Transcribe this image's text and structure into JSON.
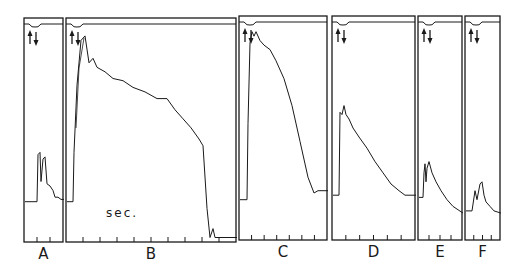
{
  "chart_data": {
    "type": "line",
    "title": "",
    "xlabel": "sec.",
    "ylabel": "",
    "grid": false,
    "legend": null,
    "panels": [
      {
        "label": "A",
        "box": [
          24,
          18,
          63,
          242
        ],
        "ticks": 2,
        "baseline": 82,
        "trace": [
          [
            0,
            82
          ],
          [
            12,
            82
          ],
          [
            13,
            61
          ],
          [
            15,
            60
          ],
          [
            16,
            73
          ],
          [
            18,
            63
          ],
          [
            20,
            62
          ],
          [
            22,
            74
          ],
          [
            25,
            75
          ],
          [
            28,
            77
          ],
          [
            30,
            80
          ],
          [
            33,
            80
          ],
          [
            36,
            81
          ],
          [
            39,
            81
          ]
        ]
      },
      {
        "label": "B",
        "box": [
          66,
          18,
          236,
          242
        ],
        "ticks": 9,
        "baseline": 82,
        "trace": [
          [
            0,
            82
          ],
          [
            6,
            82
          ],
          [
            7,
            60
          ],
          [
            10,
            30
          ],
          [
            14,
            10
          ],
          [
            18,
            8
          ],
          [
            22,
            20
          ],
          [
            26,
            18
          ],
          [
            30,
            22
          ],
          [
            38,
            24
          ],
          [
            46,
            27
          ],
          [
            56,
            28
          ],
          [
            66,
            31
          ],
          [
            78,
            33
          ],
          [
            90,
            36
          ],
          [
            100,
            36
          ],
          [
            108,
            41
          ],
          [
            116,
            45
          ],
          [
            124,
            49
          ],
          [
            132,
            54
          ],
          [
            136,
            57
          ],
          [
            140,
            85
          ],
          [
            143,
            98
          ],
          [
            146,
            94
          ],
          [
            148,
            98
          ],
          [
            170,
            98
          ]
        ]
      },
      {
        "label": "C",
        "box": [
          239,
          16,
          327,
          240
        ],
        "ticks": 6,
        "baseline": 82,
        "trace": [
          [
            0,
            82
          ],
          [
            7,
            82
          ],
          [
            8,
            48
          ],
          [
            10,
            12
          ],
          [
            12,
            7
          ],
          [
            14,
            9
          ],
          [
            16,
            7
          ],
          [
            20,
            11
          ],
          [
            24,
            13
          ],
          [
            30,
            15
          ],
          [
            36,
            20
          ],
          [
            44,
            28
          ],
          [
            52,
            40
          ],
          [
            60,
            56
          ],
          [
            68,
            72
          ],
          [
            74,
            79
          ],
          [
            78,
            78
          ],
          [
            88,
            78
          ]
        ]
      },
      {
        "label": "D",
        "box": [
          332,
          16,
          415,
          240
        ],
        "ticks": 5,
        "baseline": 80,
        "trace": [
          [
            0,
            80
          ],
          [
            6,
            80
          ],
          [
            7,
            43
          ],
          [
            9,
            44
          ],
          [
            11,
            40
          ],
          [
            13,
            44
          ],
          [
            16,
            46
          ],
          [
            20,
            50
          ],
          [
            26,
            54
          ],
          [
            34,
            59
          ],
          [
            42,
            65
          ],
          [
            50,
            70
          ],
          [
            58,
            75
          ],
          [
            66,
            78
          ],
          [
            72,
            80
          ],
          [
            83,
            80
          ]
        ]
      },
      {
        "label": "E",
        "box": [
          418,
          16,
          462,
          240
        ],
        "ticks": 3,
        "baseline": 81,
        "trace": [
          [
            0,
            81
          ],
          [
            4,
            81
          ],
          [
            5,
            70
          ],
          [
            6,
            66
          ],
          [
            7,
            74
          ],
          [
            8,
            68
          ],
          [
            10,
            65
          ],
          [
            13,
            70
          ],
          [
            17,
            74
          ],
          [
            22,
            78
          ],
          [
            28,
            82
          ],
          [
            34,
            85
          ],
          [
            44,
            88
          ]
        ]
      },
      {
        "label": "F",
        "box": [
          465,
          16,
          500,
          240
        ],
        "ticks": 3,
        "baseline": 87,
        "trace": [
          [
            0,
            87
          ],
          [
            6,
            87
          ],
          [
            9,
            78
          ],
          [
            11,
            82
          ],
          [
            14,
            75
          ],
          [
            16,
            74
          ],
          [
            18,
            80
          ],
          [
            20,
            83
          ],
          [
            24,
            85
          ],
          [
            28,
            87
          ],
          [
            35,
            88
          ]
        ]
      }
    ]
  },
  "figure": {
    "panel_labels": [
      "A",
      "B",
      "C",
      "D",
      "E",
      "F"
    ],
    "time_label": "sec.",
    "stroke_color": "#1a1a1a",
    "background": "#ffffff"
  }
}
